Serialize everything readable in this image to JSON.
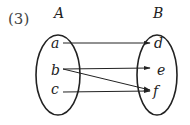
{
  "diagram": {
    "label": "(3)",
    "sets": [
      {
        "name": "A",
        "elements": [
          "a",
          "b",
          "c"
        ]
      },
      {
        "name": "B",
        "elements": [
          "d",
          "e",
          "f"
        ]
      }
    ],
    "mappings": [
      {
        "from": "a",
        "to": "d"
      },
      {
        "from": "b",
        "to": "e"
      },
      {
        "from": "b",
        "to": "f"
      },
      {
        "from": "c",
        "to": "f"
      }
    ]
  }
}
